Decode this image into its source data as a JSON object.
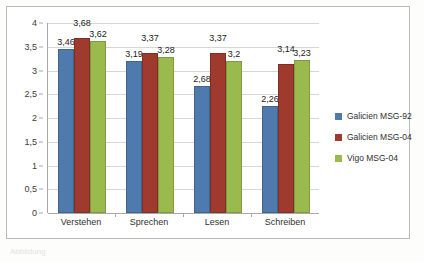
{
  "chart_data": {
    "type": "bar",
    "title": "",
    "subtitle": "",
    "xlabel": "",
    "ylabel": "",
    "categories": [
      "Verstehen",
      "Sprechen",
      "Lesen",
      "Schreiben"
    ],
    "series": [
      {
        "name": "Galicien MSG-92",
        "color": "#4f7aad",
        "values": [
          3.46,
          3.19,
          2.68,
          2.26
        ],
        "labels": [
          "3,46",
          "3,19",
          "2,68",
          "2,26"
        ]
      },
      {
        "name": "Galicien MSG-04",
        "color": "#9e3b2e",
        "values": [
          3.68,
          3.37,
          3.37,
          3.14
        ],
        "labels": [
          "3,68",
          "3,37",
          "3,37",
          "3,14"
        ]
      },
      {
        "name": "Vigo MSG-04",
        "color": "#9bba4e",
        "values": [
          3.62,
          3.28,
          3.2,
          3.23
        ],
        "labels": [
          "3,62",
          "3,28",
          "3,2",
          "3,23"
        ]
      }
    ],
    "ylim": [
      0,
      4
    ],
    "yticks": [
      0,
      0.5,
      1,
      1.5,
      2,
      2.5,
      3,
      3.5,
      4
    ],
    "ytick_labels": [
      "0",
      "0,5",
      "1",
      "1,5",
      "2",
      "2,5",
      "3",
      "3,5",
      "4"
    ],
    "grid": true,
    "legend_position": "right",
    "decimal_separator": ","
  },
  "caption": {
    "text": "Abbildung"
  }
}
